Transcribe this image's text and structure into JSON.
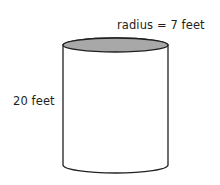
{
  "figure": {
    "name": "cylinder-diagram",
    "shape": "cylinder",
    "labels": {
      "radius": "radius = 7 feet",
      "height": "20 feet"
    },
    "measurements": {
      "radius_value": 7,
      "radius_unit": "feet",
      "height_value": 20,
      "height_unit": "feet"
    },
    "colors": {
      "outline": "#231f20",
      "top_face_fill": "#a8a8a8",
      "body_fill": "#ffffff",
      "text": "#231f20",
      "background": "#ffffff"
    },
    "geometry": {
      "left_x": 63,
      "right_x": 168,
      "top_ellipse_center_y": 45,
      "top_ellipse_ry": 7,
      "bottom_arc_center_y": 165,
      "bottom_arc_ry": 8
    }
  }
}
